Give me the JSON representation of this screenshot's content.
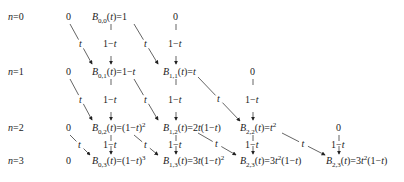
{
  "rows": [
    {
      "label": "n=0",
      "y": 17
    },
    {
      "label": "n=1",
      "y": 72
    },
    {
      "label": "n=2",
      "y": 128
    },
    {
      "label": "n=3",
      "y": 161
    }
  ],
  "zero_label": "0",
  "edge_vertical_label": "1−t",
  "edge_diagonal_label": "t",
  "nodes": [
    {
      "id": "B00",
      "html": "<i>B</i><sub>0,0</sub>(<i>t</i>)=1",
      "x": 92,
      "y": 17
    },
    {
      "id": "B01",
      "html": "<i>B</i><sub>0,1</sub>(<i>t</i>)=1−<i>t</i>",
      "x": 92,
      "y": 72
    },
    {
      "id": "B11",
      "html": "<i>B</i><sub>1,1</sub>(<i>t</i>)=<i>t</i>",
      "x": 163,
      "y": 72
    },
    {
      "id": "B02",
      "html": "<i>B</i><sub>0,2</sub>(<i>t</i>)=(1−<i>t</i>)<sup>2</sup>",
      "x": 92,
      "y": 128
    },
    {
      "id": "B12",
      "html": "<i>B</i><sub>1,2</sub>(<i>t</i>)=2<i>t</i>(1−<i>t</i>)",
      "x": 163,
      "y": 128
    },
    {
      "id": "B22",
      "html": "<i>B</i><sub>2,2</sub>(<i>t</i>)=<i>t</i><sup>2</sup>",
      "x": 240,
      "y": 128
    },
    {
      "id": "B03",
      "html": "<i>B</i><sub>0,3</sub>(<i>t</i>)=(1−<i>t</i>)<sup>3</sup>",
      "x": 92,
      "y": 161
    },
    {
      "id": "B13",
      "html": "<i>B</i><sub>1,3</sub>(<i>t</i>)=3<i>t</i>(1−<i>t</i>)<sup>2</sup>",
      "x": 163,
      "y": 161
    },
    {
      "id": "B23",
      "html": "<i>B</i><sub>2,3</sub>(<i>t</i>)=3<i>t</i><sup>2</sup>(1−<i>t</i>)",
      "x": 240,
      "y": 161
    },
    {
      "id": "B33",
      "html": "<i>B</i><sub>2,3</sub>(<i>t</i>)=3<i>t</i><sup>2</sup>(1−<i>t</i>)",
      "x": 326,
      "y": 161
    }
  ],
  "zeros": [
    {
      "x": 66,
      "y": 17
    },
    {
      "x": 173,
      "y": 17
    },
    {
      "x": 66,
      "y": 72
    },
    {
      "x": 250,
      "y": 72
    },
    {
      "x": 66,
      "y": 128
    },
    {
      "x": 336,
      "y": 128
    },
    {
      "x": 66,
      "y": 161
    }
  ],
  "vertical_edges": [
    {
      "x": 111,
      "y1": 24,
      "y2": 64
    },
    {
      "x": 176,
      "y1": 24,
      "y2": 64
    },
    {
      "x": 111,
      "y1": 79,
      "y2": 120
    },
    {
      "x": 176,
      "y1": 79,
      "y2": 120
    },
    {
      "x": 253,
      "y1": 79,
      "y2": 120
    },
    {
      "x": 111,
      "y1": 135,
      "y2": 154
    },
    {
      "x": 176,
      "y1": 135,
      "y2": 154
    },
    {
      "x": 253,
      "y1": 135,
      "y2": 154
    },
    {
      "x": 339,
      "y1": 135,
      "y2": 154
    }
  ],
  "diagonal_edges": [
    {
      "x1": 70,
      "y1": 24,
      "x2": 92,
      "y2": 64
    },
    {
      "x1": 134,
      "y1": 24,
      "x2": 158,
      "y2": 64
    },
    {
      "x1": 70,
      "y1": 79,
      "x2": 92,
      "y2": 120
    },
    {
      "x1": 134,
      "y1": 79,
      "x2": 158,
      "y2": 120
    },
    {
      "x1": 198,
      "y1": 77,
      "x2": 240,
      "y2": 121
    },
    {
      "x1": 70,
      "y1": 135,
      "x2": 90,
      "y2": 155
    },
    {
      "x1": 134,
      "y1": 135,
      "x2": 158,
      "y2": 155
    },
    {
      "x1": 198,
      "y1": 133,
      "x2": 236,
      "y2": 155
    },
    {
      "x1": 282,
      "y1": 133,
      "x2": 325,
      "y2": 155
    }
  ]
}
